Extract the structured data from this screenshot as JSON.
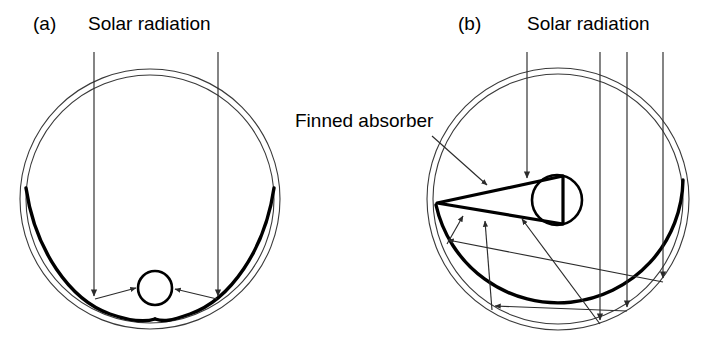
{
  "figure": {
    "type": "technical-diagram",
    "background_color": "#ffffff",
    "ink_color": "#000000",
    "glass_color": "#3a3a3a",
    "ray_color": "#2b2b2b"
  },
  "panels": [
    {
      "tag": "(a)",
      "tag_x": 33,
      "tag_y": 30,
      "title": "Solar radiation",
      "title_x": 88,
      "title_y": 30,
      "collector_type": "cusp-reflector-with-round-absorber",
      "geometry": {
        "outer_glass_cx": 150,
        "outer_glass_cy": 199,
        "outer_glass_r": 130,
        "inner_glass_r": 124,
        "absorber_cx": 155,
        "absorber_cy": 288,
        "absorber_r": 17,
        "cusp_x": 155,
        "cusp_y": 319
      },
      "ray_count": 2,
      "ray_x_positions": [
        94,
        218
      ],
      "ray_start_y": 52
    },
    {
      "tag": "(b)",
      "tag_x": 458,
      "tag_y": 30,
      "title": "Solar radiation",
      "title_x": 527,
      "title_y": 30,
      "collector_type": "finned-absorber-with-circular-reflector",
      "geometry": {
        "outer_glass_cx": 558,
        "outer_glass_cy": 199,
        "outer_glass_r": 131,
        "inner_glass_r": 125,
        "absorber_cx": 557,
        "absorber_cy": 200,
        "absorber_r": 25,
        "fin_tip_x": 437,
        "fin_tip_y": 203
      },
      "ray_count": 4,
      "ray_x_positions": [
        527,
        600,
        627,
        663
      ],
      "ray_start_y": 52
    }
  ],
  "annotations": [
    {
      "name": "finned-absorber-callout",
      "text": "Finned absorber",
      "text_x": 295,
      "text_y": 127,
      "leader_from_x": 432,
      "leader_from_y": 136,
      "leader_to_x": 487,
      "leader_to_y": 185
    }
  ],
  "labels": {
    "panel_a_tag": "(a)",
    "panel_b_tag": "(b)",
    "solar_radiation_a": "Solar radiation",
    "solar_radiation_b": "Solar radiation",
    "finned_absorber": "Finned absorber"
  }
}
